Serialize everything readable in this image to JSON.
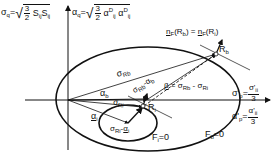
{
  "diagram": {
    "type": "yield-surface-schematic",
    "formulas": {
      "sigma_q": {
        "lhs": "σ",
        "lhs_sub": "q",
        "eq": "=",
        "coef_num": "3",
        "coef_den": "2",
        "body": "S",
        "body_sub1": "ij",
        "body2": "S",
        "body_sub2": "ij"
      },
      "alpha_q": {
        "lhs": "α",
        "lhs_sub": "q",
        "eq": "=",
        "coef_num": "3",
        "coef_den": "2",
        "body": "α",
        "body_sup1": "D",
        "body_sub1": "ij",
        "body2": "α",
        "body_sup2": "D",
        "body_sub2": "ij"
      },
      "normal_condition": {
        "lhs": "n",
        "lhs_sub": "F",
        "lhs_arg": "(R",
        "lhs_arg_sub": "b",
        "lhs_close": ")",
        "eq": "=",
        "rhs": "n",
        "rhs_sub": "F",
        "rhs_arg": "(R",
        "rhs_arg_sub": "i",
        "rhs_close": ")"
      },
      "beta": {
        "lhs": "β",
        "eq": "=",
        "a": "σ",
        "a_sub": "R",
        "a_subsub": "b",
        "minus": "-",
        "b": "σ",
        "b_sub": "R",
        "b_subsub": "i"
      },
      "sigma_p": {
        "lhs": "σ'",
        "lhs_sub": "p",
        "eq": "=",
        "num": "σ'",
        "num_sub": "ii",
        "den": "3"
      },
      "alpha_p": {
        "lhs": "α'",
        "lhs_sub": "p",
        "eq": "=",
        "num": "α'",
        "num_sub": "ii",
        "den": "3"
      }
    },
    "labels": {
      "Rb": {
        "main": "R",
        "sub": "b"
      },
      "Ri": {
        "main": "R",
        "sub": "i"
      },
      "alpha_b": {
        "main": "α",
        "sub": "b"
      },
      "alpha_i": {
        "main": "α",
        "sub": "i"
      },
      "sigma_Rb": {
        "main": "σ",
        "sub": "R",
        "subsub": "b"
      },
      "sigma_Ri": {
        "main": "σ",
        "sub": "R",
        "subsub": "i"
      },
      "sigma_Rb_minus_alpha_b": {
        "a": "σ",
        "a_sub": "Rb",
        "minus": "-",
        "b": "α",
        "b_sub": "b"
      },
      "sigma_Ri_minus_alpha_i": {
        "a": "σ",
        "a_sub": "Ri",
        "minus": "-",
        "b": "α",
        "b_sub": "i"
      },
      "Fi": "F",
      "Fi_sub": "i",
      "Fi_eq": "=0",
      "Fb": "F",
      "Fb_sub": "b",
      "Fb_eq": "=0"
    },
    "colors": {
      "line": "#111111",
      "background": "#ffffff"
    }
  }
}
